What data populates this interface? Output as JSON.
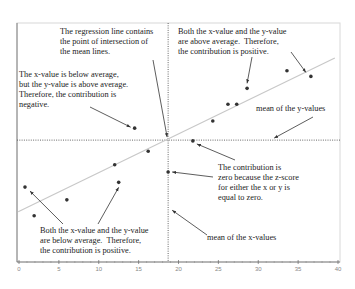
{
  "chart_data": {
    "type": "scatter",
    "title": "",
    "xlabel": "",
    "ylabel": "",
    "xlim": [
      0,
      40
    ],
    "ylim": [
      0,
      30
    ],
    "x_ticks": [
      "0",
      "5",
      "10",
      "15",
      "20",
      "25",
      "30",
      "35",
      "40"
    ],
    "grid": false,
    "points": [
      {
        "x": 0.75,
        "y": 9.4
      },
      {
        "x": 1.9,
        "y": 5.8
      },
      {
        "x": 6.0,
        "y": 7.8
      },
      {
        "x": 12.0,
        "y": 12.2
      },
      {
        "x": 12.5,
        "y": 10.0
      },
      {
        "x": 16.2,
        "y": 13.9
      },
      {
        "x": 14.5,
        "y": 16.8
      },
      {
        "x": 18.7,
        "y": 11.3
      },
      {
        "x": 21.8,
        "y": 15.2
      },
      {
        "x": 24.3,
        "y": 17.7
      },
      {
        "x": 26.2,
        "y": 19.8
      },
      {
        "x": 27.3,
        "y": 19.8
      },
      {
        "x": 28.6,
        "y": 21.8
      },
      {
        "x": 33.6,
        "y": 24.0
      },
      {
        "x": 36.6,
        "y": 23.3
      }
    ],
    "mean_x": 18.7,
    "mean_y": 15.3,
    "regression_line": {
      "x1": -0.1,
      "y1": 6.3,
      "x2": 39.6,
      "y2": 25.6
    },
    "annotations": [
      {
        "id": "regression",
        "text": "The regression line contains\nthe point of intersection of\nthe mean lines.",
        "target": {
          "x": 18.7,
          "y": 15.3
        }
      },
      {
        "id": "upper-left",
        "text": "The x-value is below average,\nbut the y-value is above average.\nTherefore, the contribution is\nnegative.",
        "target": {
          "x": 14.5,
          "y": 16.8
        }
      },
      {
        "id": "upper-right",
        "text": "Both the x-value and the y-value\nare above average.  Therefore,\nthe contribution is positive.",
        "targets": [
          {
            "x": 28.6,
            "y": 21.8
          },
          {
            "x": 36.6,
            "y": 23.3
          }
        ]
      },
      {
        "id": "mean-y",
        "text": "mean of the y-values",
        "target": {
          "x": 34.0,
          "y": 15.3
        }
      },
      {
        "id": "zero",
        "text": "The contribution is\nzero because the z-score\nfor either the x or y is\nequal to zero.",
        "targets": [
          {
            "x": 21.8,
            "y": 15.2
          },
          {
            "x": 18.7,
            "y": 11.3
          }
        ]
      },
      {
        "id": "lower-left",
        "text": "Both the x-value and the y-value\nare below average.  Therefore,\nthe contribution is positive.",
        "targets": [
          {
            "x": 0.75,
            "y": 9.4
          },
          {
            "x": 12.5,
            "y": 10.0
          }
        ]
      },
      {
        "id": "mean-x",
        "text": "mean of the x-values",
        "target": {
          "x": 18.7,
          "y": 5.0
        }
      }
    ],
    "colors": {
      "points": "#333333",
      "regression": "#c8c8c8",
      "mean_lines": "#555555",
      "frame": "#d8d8d8",
      "arrows": "#333333"
    }
  }
}
